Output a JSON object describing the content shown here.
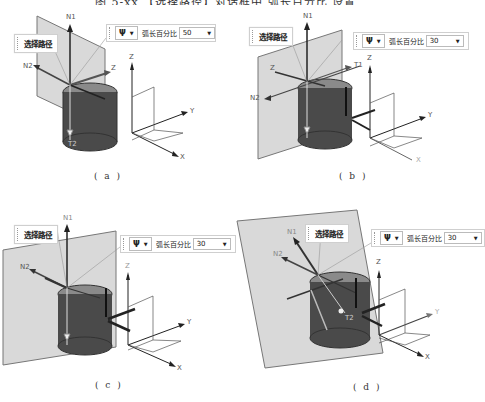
{
  "figure_title": "图 5-xx 【选择路径】对话框中 弧长百分比 设置",
  "panels": [
    {
      "id": "a",
      "caption": "( a )",
      "path_label": "选择路径",
      "toolbar": {
        "icon": "Ψ",
        "label": "弧长百分比",
        "value": "50"
      },
      "axes": {
        "n1": "N1",
        "n2": "N2",
        "t1": "Z",
        "t2": "T2",
        "z": "Z",
        "y": "Y",
        "x": "X"
      }
    },
    {
      "id": "b",
      "caption": "( b )",
      "path_label": "选择路径",
      "toolbar": {
        "icon": "Ψ",
        "label": "弧长百分比",
        "value": "30"
      },
      "axes": {
        "n1": "N1",
        "n2": "N2",
        "t1": "T1",
        "t2": "Z",
        "z": "Z",
        "y": "Y",
        "x": "X"
      }
    },
    {
      "id": "c",
      "caption": "( c )",
      "path_label": "选择路径",
      "toolbar": {
        "icon": "Ψ",
        "label": "弧长百分比",
        "value": "30"
      },
      "axes": {
        "n1": "N1",
        "n2": "N2",
        "z": "Z",
        "y": "Y",
        "x": "X"
      }
    },
    {
      "id": "d",
      "caption": "( d )",
      "path_label": "选择路径",
      "toolbar": {
        "icon": "Ψ",
        "label": "弧长百分比",
        "value": "30"
      },
      "axes": {
        "n1": "N1",
        "n2": "N2",
        "t2": "T2",
        "z": "Z",
        "y": "Y",
        "x": "X"
      }
    }
  ]
}
